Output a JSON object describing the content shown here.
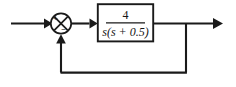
{
  "diagram": {
    "type": "control-system-block-diagram",
    "input_signal": {
      "label": "",
      "direction": "right"
    },
    "summing_junction": {
      "name": "summing-junction",
      "shape": "circle-with-x-cross",
      "signs": {
        "input_left": "+",
        "feedback_bottom": "−"
      },
      "center_x": 61,
      "center_y": 23,
      "radius": 10
    },
    "plant_block": {
      "name": "transfer-function-block",
      "transfer_function": "4/(s(s + 0.5))",
      "numerator": "4",
      "denominator_parts": {
        "s_outer": "s",
        "open_paren": "(",
        "s_inner": "s",
        "plus": " + ",
        "constant": "0.5",
        "close_paren": ")"
      },
      "denominator_plain": "s(s + 0.5)"
    },
    "feedback_path": {
      "name": "unity-feedback-path",
      "gain": "1",
      "sign": "negative",
      "tap_x": 186,
      "bottom_y": 72
    },
    "output_signal": {
      "label": "",
      "direction": "right"
    },
    "colors": {
      "line": "#1a1a1a",
      "background": "#ffffff",
      "text": "#151515"
    }
  }
}
